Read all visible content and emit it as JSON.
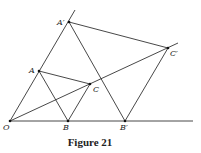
{
  "figure": {
    "caption": "Figure 21",
    "points": [
      {
        "id": "O",
        "label": "O",
        "x": 10,
        "y": 121,
        "lx": 3,
        "ly": 130
      },
      {
        "id": "B",
        "label": "B",
        "x": 68,
        "y": 121,
        "lx": 63,
        "ly": 130
      },
      {
        "id": "Bp",
        "label": "B′",
        "x": 125,
        "y": 121,
        "lx": 120,
        "ly": 130
      },
      {
        "id": "A",
        "label": "A",
        "x": 39,
        "y": 71,
        "lx": 29,
        "ly": 73
      },
      {
        "id": "Ap",
        "label": "A′",
        "x": 69,
        "y": 22,
        "lx": 57,
        "ly": 25
      },
      {
        "id": "C",
        "label": "C",
        "x": 90,
        "y": 84,
        "lx": 93,
        "ly": 92
      },
      {
        "id": "Cp",
        "label": "C′",
        "x": 168,
        "y": 48,
        "lx": 170,
        "ly": 56
      }
    ],
    "segments": [
      {
        "from": [
          10,
          121
        ],
        "to": [
          193,
          121
        ],
        "name": "ray-ob"
      },
      {
        "from": [
          10,
          121
        ],
        "to": [
          75,
          10
        ],
        "name": "ray-oa"
      },
      {
        "from": [
          10,
          121
        ],
        "to": [
          178,
          43
        ],
        "name": "ray-oc"
      },
      {
        "from": [
          39,
          71
        ],
        "to": [
          68,
          121
        ],
        "name": "segment-ab"
      },
      {
        "from": [
          39,
          71
        ],
        "to": [
          90,
          84
        ],
        "name": "segment-ac"
      },
      {
        "from": [
          68,
          121
        ],
        "to": [
          90,
          84
        ],
        "name": "segment-bc"
      },
      {
        "from": [
          69,
          22
        ],
        "to": [
          125,
          121
        ],
        "name": "segment-apbp"
      },
      {
        "from": [
          69,
          22
        ],
        "to": [
          168,
          48
        ],
        "name": "segment-apcp"
      },
      {
        "from": [
          125,
          121
        ],
        "to": [
          168,
          48
        ],
        "name": "segment-bpcp"
      }
    ]
  }
}
